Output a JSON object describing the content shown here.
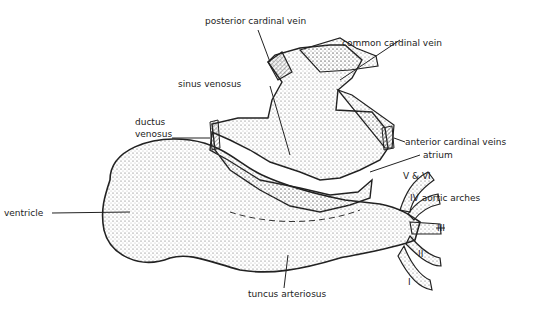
{
  "diagram": {
    "labels": {
      "posterior_cardinal_vein": "posterior cardinal vein",
      "common_cardinal_vein": "common cardinal vein",
      "sinus_venosus": "sinus venosus",
      "ductus_venosus_1": "ductus",
      "ductus_venosus_2": "venosus",
      "anterior_cardinal_veins": "anterior cardinal veins",
      "atrium": "atrium",
      "arch_v_vi": "V & VI",
      "arch_iv": "IV aortic arches",
      "arch_iii": "III",
      "arch_ii": "II",
      "arch_i": "I",
      "ventricle": "ventricle",
      "truncus": "tuncus arteriosus"
    },
    "colors": {
      "ink": "#222222",
      "fill": "#f4f4f4",
      "stipple": "#555555"
    }
  }
}
